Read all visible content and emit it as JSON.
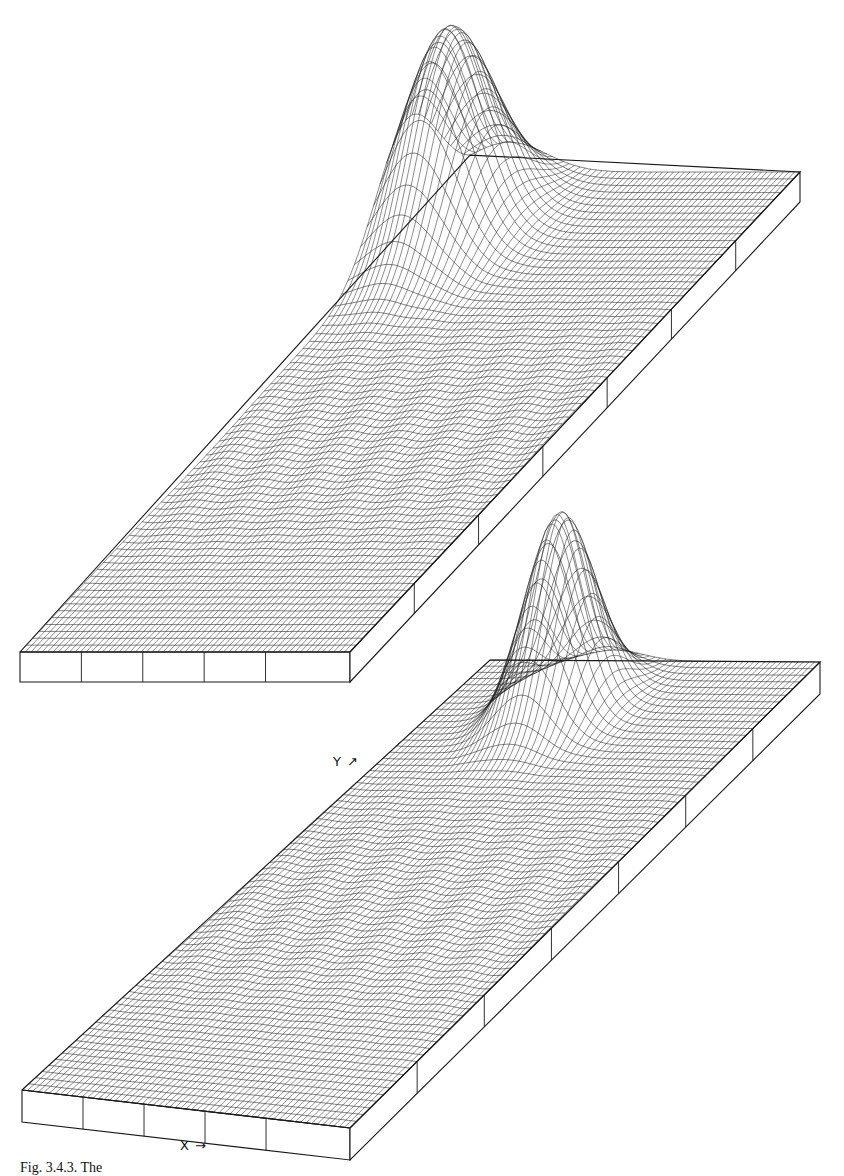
{
  "figure": {
    "caption": "Fig. 3.4.3. The",
    "panels": [
      {
        "id": "upper",
        "description": "3D wireframe surface on rectangular slab with single Gaussian-like peak near back-center",
        "slab": {
          "front_left": [
            20,
            652
          ],
          "front_right": [
            350,
            652
          ],
          "back_right": [
            800,
            172
          ],
          "back_left": [
            470,
            172
          ],
          "thickness": 30,
          "front_divisions": 5,
          "side_divisions": 7
        },
        "peak": {
          "x": 488,
          "y": 28,
          "base_y": 250
        }
      },
      {
        "id": "lower",
        "description": "3D wireframe surface on rectangular slab with single Gaussian-like peak near back",
        "slab": {
          "front_left": [
            22,
            1090
          ],
          "front_right": [
            350,
            1128
          ],
          "back_right": [
            820,
            662
          ],
          "back_left": [
            490,
            660
          ],
          "thickness": 32,
          "front_divisions": 5,
          "side_divisions": 7
        },
        "peak": {
          "x": 608,
          "y": 513,
          "base_y": 700
        }
      }
    ],
    "axes": {
      "y_label": "Y",
      "x_label": "X"
    }
  },
  "chart_data": {
    "type": "surface",
    "title": "",
    "xlabel": "X",
    "ylabel": "Y",
    "panels": [
      {
        "name": "upper",
        "feature": "single peak near back edge",
        "relative_peak_height": 1.0
      },
      {
        "name": "lower",
        "feature": "single peak near back edge, sharper",
        "relative_peak_height": 0.75
      }
    ]
  }
}
